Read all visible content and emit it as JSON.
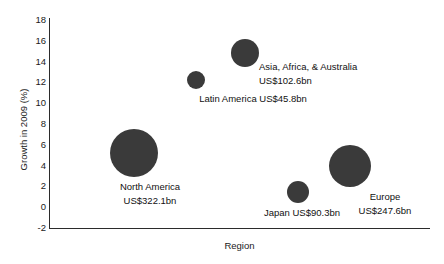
{
  "chart_data": {
    "type": "scatter",
    "subtype": "bubble",
    "title": "",
    "xlabel": "Region",
    "ylabel": "Growth in 2009 (%)",
    "ylim": [
      -2,
      18
    ],
    "yticks": [
      18,
      16,
      14,
      12,
      10,
      8,
      6,
      4,
      2,
      0,
      -2
    ],
    "ytick_labels": [
      "18",
      "16",
      "14",
      "12",
      "10",
      "8",
      "6",
      "4",
      "2",
      "0",
      "-2"
    ],
    "xticks": [],
    "xtick_labels": [],
    "grid": false,
    "legend": false,
    "bubble_color": "#3a3a3a",
    "size_unit": "US$bn",
    "size_metric": "Market value",
    "points": [
      {
        "name": "North America",
        "label_line1": "North America",
        "label_line2": "US$322.1bn",
        "value_text": "US$322.1bn",
        "size": 322.1,
        "growth": 5.3,
        "x_px": 134,
        "y_px": 153,
        "r_px": 24,
        "label_x_px": 150,
        "label_y_px": 180,
        "label_align": "center"
      },
      {
        "name": "Europe",
        "label_line1": "Europe",
        "label_line2": "US$247.6bn",
        "value_text": "US$247.6bn",
        "size": 247.6,
        "growth": 4.2,
        "x_px": 350,
        "y_px": 166,
        "r_px": 21,
        "label_x_px": 385,
        "label_y_px": 190,
        "label_align": "center"
      },
      {
        "name": "Asia, Africa, & Australia",
        "label_line1": "Asia, Africa, & Australia",
        "label_line2": "US$102.6bn",
        "value_text": "US$102.6bn",
        "size": 102.6,
        "growth": 14.7,
        "x_px": 245,
        "y_px": 53,
        "r_px": 14,
        "label_x_px": 259,
        "label_y_px": 60,
        "label_align": "left"
      },
      {
        "name": "Japan",
        "label_line1": "Japan US$90.3bn",
        "label_line2": "",
        "value_text": "US$90.3bn",
        "size": 90.3,
        "growth": 1.8,
        "x_px": 298,
        "y_px": 192,
        "r_px": 11,
        "label_x_px": 302,
        "label_y_px": 206,
        "label_align": "center"
      },
      {
        "name": "Latin America",
        "label_line1": "Latin America US$45.8bn",
        "label_line2": "",
        "value_text": "US$45.8bn",
        "size": 45.8,
        "growth": 12.5,
        "x_px": 196,
        "y_px": 80,
        "r_px": 9,
        "label_x_px": 253,
        "label_y_px": 92,
        "label_align": "center"
      }
    ]
  }
}
